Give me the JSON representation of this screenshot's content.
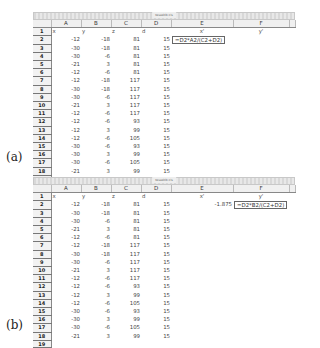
{
  "window_title": "tesseklb.xls",
  "columns": [
    "A",
    "B",
    "C",
    "D",
    "E",
    "F"
  ],
  "header_row": {
    "A": "x",
    "B": "y",
    "C": "z",
    "D": "d",
    "E": "x'",
    "F": "y'"
  },
  "rows": [
    {
      "n": "2",
      "A": "-12",
      "B": "-18",
      "C": "81",
      "D": "15"
    },
    {
      "n": "3",
      "A": "-30",
      "B": "-18",
      "C": "81",
      "D": "15"
    },
    {
      "n": "4",
      "A": "-30",
      "B": "-6",
      "C": "81",
      "D": "15"
    },
    {
      "n": "5",
      "A": "-21",
      "B": "3",
      "C": "81",
      "D": "15"
    },
    {
      "n": "6",
      "A": "-12",
      "B": "-6",
      "C": "81",
      "D": "15"
    },
    {
      "n": "7",
      "A": "-12",
      "B": "-18",
      "C": "117",
      "D": "15"
    },
    {
      "n": "8",
      "A": "-30",
      "B": "-18",
      "C": "117",
      "D": "15"
    },
    {
      "n": "9",
      "A": "-30",
      "B": "-6",
      "C": "117",
      "D": "15"
    },
    {
      "n": "10",
      "A": "-21",
      "B": "3",
      "C": "117",
      "D": "15"
    },
    {
      "n": "11",
      "A": "-12",
      "B": "-6",
      "C": "117",
      "D": "15"
    },
    {
      "n": "12",
      "A": "-12",
      "B": "-6",
      "C": "93",
      "D": "15"
    },
    {
      "n": "13",
      "A": "-12",
      "B": "3",
      "C": "99",
      "D": "15"
    },
    {
      "n": "14",
      "A": "-12",
      "B": "-6",
      "C": "105",
      "D": "15"
    },
    {
      "n": "15",
      "A": "-30",
      "B": "-6",
      "C": "93",
      "D": "15"
    },
    {
      "n": "16",
      "A": "-30",
      "B": "3",
      "C": "99",
      "D": "15"
    },
    {
      "n": "17",
      "A": "-30",
      "B": "-6",
      "C": "105",
      "D": "15"
    },
    {
      "n": "18",
      "A": "-21",
      "B": "3",
      "C": "99",
      "D": "15"
    }
  ],
  "last_row_number": "19",
  "panel_a": {
    "label": "(a)",
    "E2_formula": "=D2*A2/(C2+D2)"
  },
  "panel_b": {
    "label": "(b)",
    "E2_value": "-1.875",
    "F2_formula": "=D2*B2/(C2+D2)"
  }
}
